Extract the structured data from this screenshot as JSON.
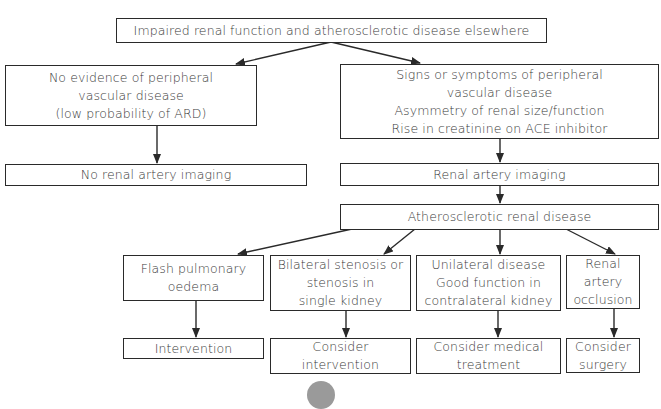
{
  "flowchart": {
    "root": {
      "lines": [
        "Impaired renal function and atherosclerotic disease elsewhere"
      ]
    },
    "left_branch": {
      "condition": {
        "lines": [
          "No evidence of peripheral",
          "vascular disease",
          "(low probability of ARD)"
        ]
      },
      "outcome": {
        "lines": [
          "No renal artery imaging"
        ]
      }
    },
    "right_branch": {
      "condition": {
        "lines": [
          "Signs or symptoms of peripheral",
          "vascular disease",
          "Asymmetry of renal size/function",
          "Rise in creatinine on ACE inhibitor"
        ]
      },
      "outcome": {
        "lines": [
          "Renal artery imaging"
        ]
      },
      "diagnosis": {
        "lines": [
          "Atherosclerotic renal disease"
        ]
      }
    },
    "subtypes": [
      {
        "condition": [
          "Flash pulmonary",
          "oedema"
        ],
        "action": [
          "Intervention"
        ]
      },
      {
        "condition": [
          "Bilateral stenosis or",
          "stenosis in",
          "single kidney"
        ],
        "action": [
          "Consider",
          "intervention"
        ]
      },
      {
        "condition": [
          "Unilateral disease",
          "Good function in",
          "contralateral kidney"
        ],
        "action": [
          "Consider medical",
          "treatment"
        ]
      },
      {
        "condition": [
          "Renal",
          "artery",
          "occlusion"
        ],
        "action": [
          "Consider",
          "surgery"
        ]
      }
    ]
  },
  "colors": {
    "line": "#2a2a2a",
    "text": "#3a3a3a",
    "circle": "#9a9a9a"
  }
}
